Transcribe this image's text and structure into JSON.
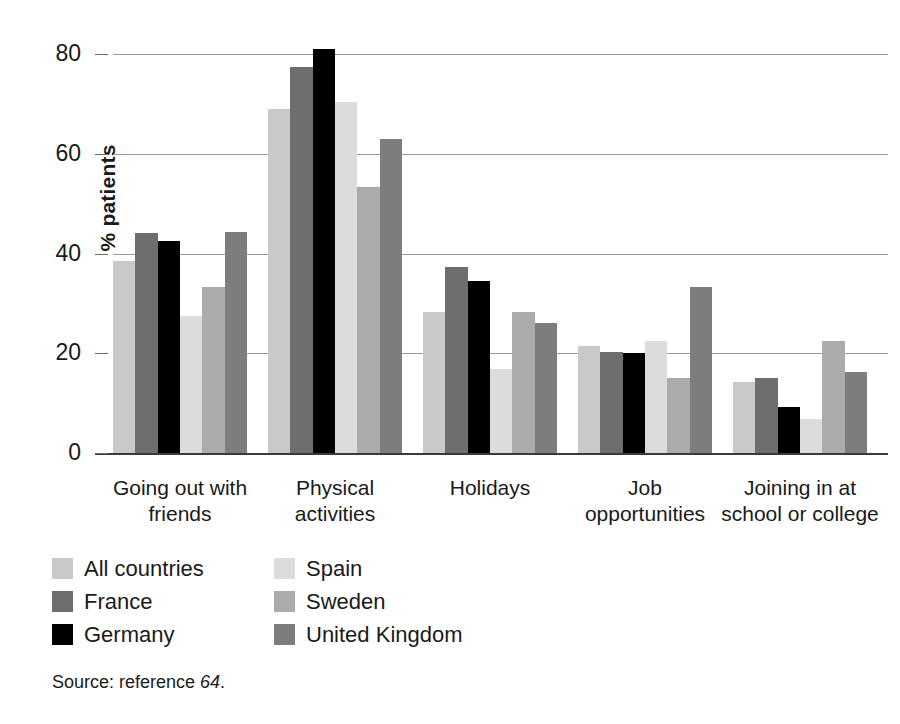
{
  "figure": {
    "source_note_prefix": "Source: reference ",
    "source_note_ref": "64",
    "source_note_suffix": "."
  },
  "legend": {
    "items": [
      {
        "label": "All countries",
        "color": "#c9c9c9",
        "column": "left"
      },
      {
        "label": "France",
        "color": "#6e6e6e",
        "column": "left"
      },
      {
        "label": "Germany",
        "color": "#000000",
        "column": "left"
      },
      {
        "label": "Spain",
        "color": "#dcdcdc",
        "column": "right"
      },
      {
        "label": "Sweden",
        "color": "#ababab",
        "column": "right"
      },
      {
        "label": "United Kingdom",
        "color": "#7d7d7d",
        "column": "right"
      }
    ]
  },
  "chart_data": {
    "type": "bar",
    "title": "",
    "xlabel": "",
    "ylabel": "% patients",
    "ylim": [
      0,
      85
    ],
    "yticks": [
      0,
      20,
      40,
      60,
      80
    ],
    "grid": true,
    "legend_position": "below",
    "categories": [
      "Going out with friends",
      "Physical activities",
      "Holidays",
      "Job opportunities",
      "Joining in at school or college"
    ],
    "category_lines": [
      [
        "Going out with",
        "friends"
      ],
      [
        "Physical",
        "activities"
      ],
      [
        "Holidays",
        ""
      ],
      [
        "Job",
        "opportunities"
      ],
      [
        "Joining in at",
        "school or college"
      ]
    ],
    "series": [
      {
        "name": "All countries",
        "color": "#c9c9c9",
        "values": [
          38.5,
          69.0,
          28.2,
          21.5,
          14.3
        ]
      },
      {
        "name": "France",
        "color": "#6e6e6e",
        "values": [
          44.2,
          77.3,
          37.3,
          20.2,
          15.0
        ]
      },
      {
        "name": "Germany",
        "color": "#000000",
        "values": [
          42.5,
          81.0,
          34.5,
          20.0,
          9.3
        ]
      },
      {
        "name": "Spain",
        "color": "#dcdcdc",
        "values": [
          27.5,
          70.3,
          16.8,
          22.5,
          6.8
        ]
      },
      {
        "name": "Sweden",
        "color": "#ababab",
        "values": [
          33.3,
          53.3,
          28.2,
          15.0,
          22.5
        ]
      },
      {
        "name": "United Kingdom",
        "color": "#7d7d7d",
        "values": [
          44.3,
          63.0,
          26.0,
          33.3,
          16.3
        ]
      }
    ]
  }
}
